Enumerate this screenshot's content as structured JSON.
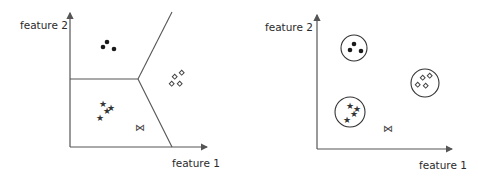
{
  "left_panel": {
    "title": "Voronoi partition of feature space",
    "y_label": "feature 2",
    "x_label": "feature 1",
    "groups": {
      "dots": [
        [
          107,
          42
        ],
        [
          103,
          48
        ],
        [
          114,
          49
        ]
      ],
      "diamonds": [
        [
          175,
          77
        ],
        [
          182,
          73
        ],
        [
          172,
          84
        ],
        [
          180,
          84
        ]
      ],
      "stars": [
        [
          103,
          103
        ],
        [
          111,
          107
        ],
        [
          107,
          110
        ],
        [
          100,
          117
        ]
      ],
      "query": [
        140,
        127
      ]
    },
    "query_symbol": "⋈",
    "star_symbol": "★"
  },
  "right_panel": {
    "title": "Clustered classes",
    "y_label": "feature 2",
    "x_label": "feature 1",
    "clusters": [
      {
        "name": "dots",
        "center": [
          354,
          48
        ],
        "r": 13
      },
      {
        "name": "diamonds",
        "center": [
          425,
          83
        ],
        "r": 14
      },
      {
        "name": "stars",
        "center": [
          350,
          112
        ],
        "r": 15
      }
    ],
    "query_symbol": "⋈",
    "star_symbol": "★"
  }
}
